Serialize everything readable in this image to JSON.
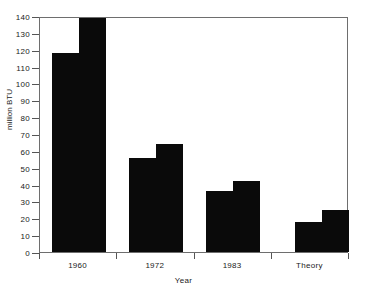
{
  "chart_data": {
    "type": "bar",
    "title": "",
    "xlabel": "Year",
    "ylabel": "million BTU",
    "categories": [
      "1960",
      "1972",
      "1983",
      "Theory"
    ],
    "series": [
      {
        "name": "series-1",
        "values": [
          118,
          56,
          36,
          18
        ]
      },
      {
        "name": "series-2",
        "values": [
          139,
          64,
          42,
          25
        ]
      }
    ],
    "ylim": [
      0,
      140
    ],
    "yticks": [
      0,
      10,
      20,
      30,
      40,
      50,
      60,
      70,
      80,
      90,
      100,
      110,
      120,
      130,
      140
    ],
    "ytick_labels": [
      "0",
      "10",
      "20",
      "30",
      "40",
      "50",
      "60",
      "70",
      "80",
      "90",
      "100",
      "110",
      "120",
      "130",
      "140"
    ],
    "grid": false,
    "legend": null,
    "bar_color": "#0a0a0a",
    "axis_color": "#6e6e6e"
  }
}
